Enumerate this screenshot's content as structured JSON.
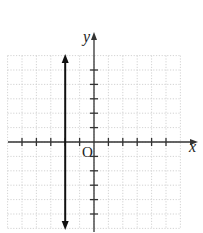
{
  "chart_data": {
    "type": "line",
    "title": "",
    "xlabel": "x",
    "ylabel": "y",
    "origin_label": "O",
    "xlim": [
      -6,
      6
    ],
    "ylim": [
      -6,
      6
    ],
    "grid": true,
    "x_ticks": [
      -5,
      -4,
      -3,
      -2,
      -1,
      1,
      2,
      3,
      4,
      5
    ],
    "y_ticks": [
      -5,
      -4,
      -3,
      -2,
      -1,
      1,
      2,
      3,
      4,
      5
    ],
    "series": [
      {
        "name": "x = -2",
        "type": "vertical-line",
        "x": -2,
        "arrows": "both"
      }
    ]
  },
  "labels": {
    "x_axis": "x",
    "y_axis": "y",
    "origin": "O"
  },
  "colors": {
    "grid": "#c8c8c8",
    "axis": "#333333",
    "line": "#111111"
  }
}
